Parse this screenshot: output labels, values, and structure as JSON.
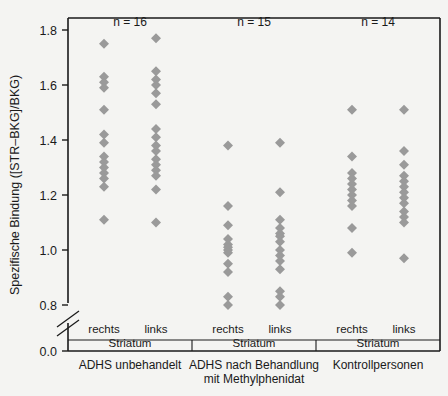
{
  "chart_data": {
    "type": "scatter",
    "title": "",
    "xlabel": "",
    "ylabel": "Spezifische Bindung ([STR–BKG]/BKG)",
    "ylim": [
      0.8,
      1.8
    ],
    "y_axis_broken": true,
    "y_break_between": [
      0.0,
      0.8
    ],
    "yticks": [
      "0.0",
      "0.8",
      "1.0",
      "1.2",
      "1.4",
      "1.6",
      "1.8"
    ],
    "ytick_values": [
      0.0,
      0.8,
      1.0,
      1.2,
      1.4,
      1.6,
      1.8
    ],
    "grid": false,
    "legend": "none",
    "marker_shape": "diamond",
    "marker_color": "#9a9a9a",
    "groups": [
      {
        "label": "ADHS unbehandelt",
        "n_label": "n = 16",
        "n": 16,
        "columns": [
          {
            "label": "rechts",
            "sublabel": "Striatum",
            "values": [
              1.75,
              1.63,
              1.61,
              1.59,
              1.51,
              1.42,
              1.39,
              1.34,
              1.32,
              1.3,
              1.28,
              1.26,
              1.23,
              1.11
            ]
          },
          {
            "label": "links",
            "sublabel": "Striatum",
            "values": [
              1.77,
              1.65,
              1.62,
              1.6,
              1.57,
              1.53,
              1.44,
              1.41,
              1.38,
              1.36,
              1.33,
              1.31,
              1.29,
              1.27,
              1.22,
              1.1
            ]
          }
        ]
      },
      {
        "label": "ADHS nach Behandlung",
        "label_line2": "mit Methylphenidat",
        "n_label": "n = 15",
        "n": 15,
        "columns": [
          {
            "label": "rechts",
            "sublabel": "Striatum",
            "values": [
              1.38,
              1.16,
              1.09,
              1.04,
              1.02,
              1.01,
              1.0,
              0.99,
              0.95,
              0.92,
              0.83,
              0.8
            ]
          },
          {
            "label": "links",
            "sublabel": "Striatum",
            "values": [
              1.39,
              1.21,
              1.11,
              1.08,
              1.06,
              1.05,
              1.03,
              1.0,
              0.98,
              0.96,
              0.93,
              0.85,
              0.83,
              0.8
            ]
          }
        ]
      },
      {
        "label": "Kontrollpersonen",
        "n_label": "n = 14",
        "n": 14,
        "columns": [
          {
            "label": "rechts",
            "sublabel": "Striatum",
            "values": [
              1.51,
              1.34,
              1.28,
              1.26,
              1.24,
              1.22,
              1.2,
              1.18,
              1.16,
              1.08,
              0.99
            ]
          },
          {
            "label": "links",
            "sublabel": "Striatum",
            "values": [
              1.51,
              1.36,
              1.31,
              1.27,
              1.25,
              1.23,
              1.21,
              1.19,
              1.17,
              1.14,
              1.12,
              1.1,
              0.97
            ]
          }
        ]
      }
    ]
  }
}
